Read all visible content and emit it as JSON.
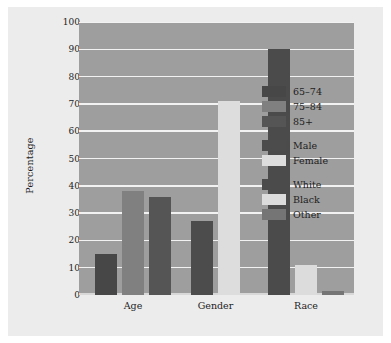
{
  "chart_data": {
    "type": "bar",
    "title": "",
    "subtitle": "",
    "xlabel": "",
    "ylabel": "Percentage",
    "ylim": [
      0,
      100
    ],
    "ytick_labels": [
      "0",
      "10",
      "20",
      "30",
      "40",
      "50",
      "60",
      "70",
      "80",
      "90",
      "100"
    ],
    "ytick_values": [
      0,
      10,
      20,
      30,
      40,
      50,
      60,
      70,
      80,
      90,
      100
    ],
    "grid": "horizontal",
    "legend_position": "right-inside",
    "categories": [
      "Age",
      "Gender",
      "Race"
    ],
    "groups": [
      {
        "category": "Age",
        "bars": [
          {
            "label": "65–74",
            "value": 15,
            "color": "#474747"
          },
          {
            "label": "75–84",
            "value": 38,
            "color": "#808080"
          },
          {
            "label": "85+",
            "value": 36,
            "color": "#555555"
          }
        ]
      },
      {
        "category": "Gender",
        "bars": [
          {
            "label": "Male",
            "value": 27,
            "color": "#4c4c4c"
          },
          {
            "label": "Female",
            "value": 71,
            "color": "#dddddd"
          }
        ]
      },
      {
        "category": "Race",
        "bars": [
          {
            "label": "White",
            "value": 90,
            "color": "#4b4b4b"
          },
          {
            "label": "Black",
            "value": 11,
            "color": "#dcdcdc"
          },
          {
            "label": "Other",
            "value": 1.5,
            "color": "#757575"
          }
        ]
      }
    ],
    "series": [
      {
        "name": "65–74",
        "values": [
          15,
          null,
          null
        ],
        "color": "#474747"
      },
      {
        "name": "75–84",
        "values": [
          38,
          null,
          null
        ],
        "color": "#808080"
      },
      {
        "name": "85+",
        "values": [
          36,
          null,
          null
        ],
        "color": "#555555"
      },
      {
        "name": "Male",
        "values": [
          null,
          27,
          null
        ],
        "color": "#4c4c4c"
      },
      {
        "name": "Female",
        "values": [
          null,
          71,
          null
        ],
        "color": "#dddddd"
      },
      {
        "name": "White",
        "values": [
          null,
          null,
          90
        ],
        "color": "#4b4b4b"
      },
      {
        "name": "Black",
        "values": [
          null,
          null,
          11
        ],
        "color": "#dcdcdc"
      },
      {
        "name": "Other",
        "values": [
          null,
          null,
          1.5
        ],
        "color": "#757575"
      }
    ],
    "legend": [
      {
        "label": "65–74",
        "color": "#474747",
        "spacer_before": false
      },
      {
        "label": "75–84",
        "color": "#808080",
        "spacer_before": false
      },
      {
        "label": "85+",
        "color": "#555555",
        "spacer_before": false
      },
      {
        "label": "Male",
        "color": "#4c4c4c",
        "spacer_before": true
      },
      {
        "label": "Female",
        "color": "#dddddd",
        "spacer_before": false
      },
      {
        "label": "White",
        "color": "#4b4b4b",
        "spacer_before": true
      },
      {
        "label": "Black",
        "color": "#dcdcdc",
        "spacer_before": false
      },
      {
        "label": "Other",
        "color": "#757575",
        "spacer_before": false
      }
    ],
    "colors": {
      "plot_background": "#9e9e9e",
      "figure_background": "#ececec",
      "gridline": "#f2f2f2",
      "text": "#1d1d1d"
    }
  }
}
